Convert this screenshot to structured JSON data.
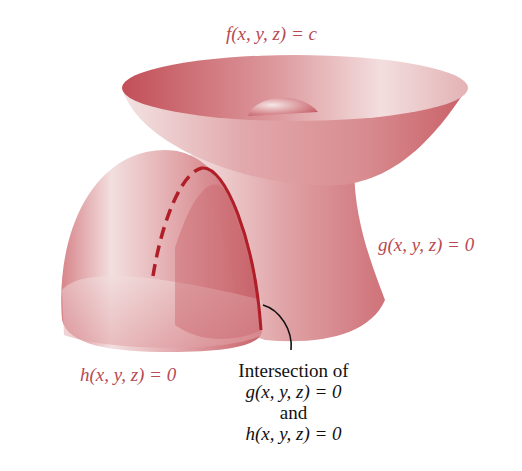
{
  "figure": {
    "labels": {
      "f_surface": "f(x, y, z) = c",
      "g_surface": "g(x, y, z) = 0",
      "h_surface": "h(x, y, z) = 0"
    },
    "annotation": {
      "line1": "Intersection of",
      "line2": "g(x, y, z) = 0",
      "line3": "and",
      "line4": "h(x, y, z) = 0"
    },
    "colors": {
      "surface": "#c65a62",
      "surface_light": "#f4dcdc",
      "curve": "#b01e28",
      "label": "#b84a52",
      "text": "#111111"
    }
  }
}
